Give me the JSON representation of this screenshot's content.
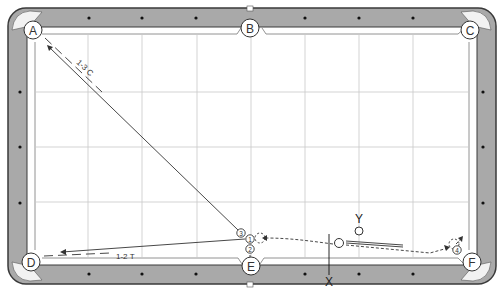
{
  "diagram": {
    "type": "billiards-shot-diagram",
    "colors": {
      "rail": "#a9a9a9",
      "rail_border": "#3a3a3a",
      "cloth": "#ffffff",
      "grid": "#c8c8c8",
      "line": "#333333",
      "diamond": "#111111"
    },
    "pockets": [
      {
        "id": "A",
        "label": "A",
        "x": 33,
        "y": 30
      },
      {
        "id": "B",
        "label": "B",
        "x": 250,
        "y": 28
      },
      {
        "id": "C",
        "label": "C",
        "x": 470,
        "y": 30
      },
      {
        "id": "D",
        "label": "D",
        "x": 31,
        "y": 262
      },
      {
        "id": "E",
        "label": "E",
        "x": 251,
        "y": 266
      },
      {
        "id": "F",
        "label": "F",
        "x": 472,
        "y": 262
      }
    ],
    "annotations": {
      "shot_a": "1-3 C",
      "shot_d": "1-2 T",
      "marker_x": "X",
      "marker_y": "Y"
    },
    "numbered_balls": [
      {
        "label": "1",
        "x": 250,
        "y": 238
      },
      {
        "label": "2",
        "x": 250,
        "y": 250
      },
      {
        "label": "3",
        "x": 241,
        "y": 233
      },
      {
        "label": "4",
        "x": 457,
        "y": 250
      }
    ],
    "balls": [
      {
        "name": "cue-ball",
        "x": 339,
        "y": 243
      },
      {
        "name": "ball-y",
        "x": 359,
        "y": 231
      }
    ]
  }
}
